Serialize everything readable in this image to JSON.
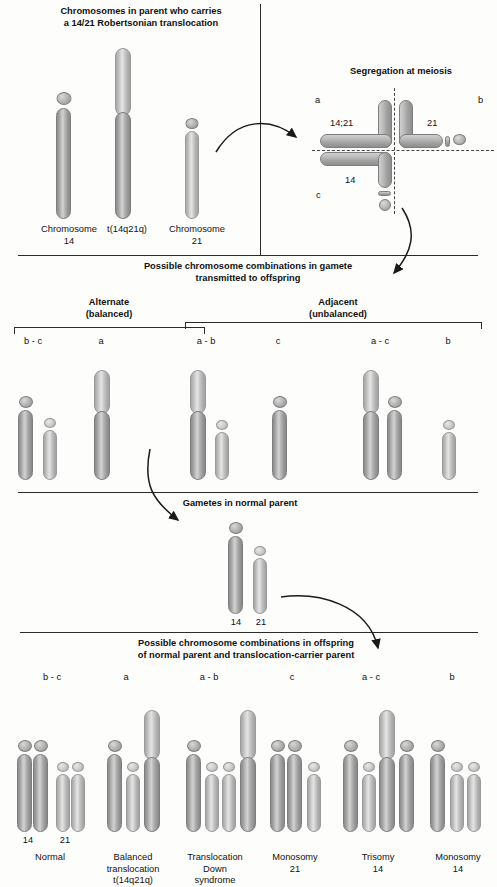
{
  "title_top": "Chromosomes in parent who carries\na 14/21 Robertsonian translocation",
  "meiosis": {
    "heading": "Segregation at meiosis",
    "label_a": "a",
    "label_b": "b",
    "label_c": "c",
    "label_1421": "14;21",
    "label_21": "21",
    "label_14": "14"
  },
  "parent": {
    "chr14_label": "Chromosome\n14",
    "translocation_label": "t(14q21q)",
    "chr21_label": "Chromosome\n21"
  },
  "divider1_text": "Possible chromosome combinations in gamete\ntransmitted to offspring",
  "gametes": {
    "alternate_heading": "Alternate\n(balanced)",
    "adjacent_heading": "Adjacent\n(unbalanced)",
    "labels": [
      "b - c",
      "a",
      "a - b",
      "c",
      "a - c",
      "b"
    ]
  },
  "divider2_text": "Gametes in normal parent",
  "normal_parent": {
    "label_14": "14",
    "label_21": "21"
  },
  "divider3_text": "Possible chromosome combinations in offspring\nof normal parent and translocation-carrier parent",
  "offspring": {
    "combo_labels": [
      "b - c",
      "a",
      "a - b",
      "c",
      "a - c",
      "b"
    ],
    "chr14_tick": "14",
    "chr21_tick": "21",
    "outcomes": [
      "Normal",
      "Balanced\ntranslocation\nt(14q21q)",
      "Translocation\nDown\nsyndrome",
      "Monosomy\n21",
      "Trisomy\n14",
      "Monosomy\n14"
    ]
  },
  "colors": {
    "chromosome_gray": "#a5a5a5",
    "chromosome_light": "#c6c6c6",
    "line": "#2b2b2b",
    "background": "#fdfdfc"
  }
}
